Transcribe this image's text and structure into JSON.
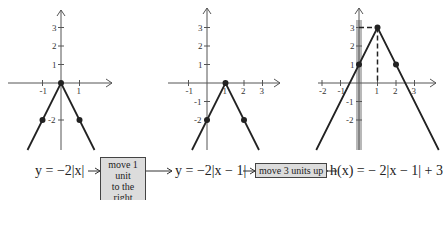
{
  "graphs": [
    {
      "name": "graph-base",
      "function": "y = -2|x|",
      "x_ticks": [
        "-1",
        "1"
      ],
      "x_tick_values": [
        -1,
        1
      ],
      "y_ticks": [
        "1",
        "2",
        "3",
        "-2"
      ],
      "y_tick_values": [
        1,
        2,
        3,
        -2
      ],
      "vertex": [
        0,
        0
      ],
      "points": [
        [
          0,
          0
        ],
        [
          -1,
          -2
        ],
        [
          1,
          -2
        ]
      ]
    },
    {
      "name": "graph-shift-right",
      "function": "y = -2|x - 1|",
      "x_ticks": [
        "-1",
        "1",
        "2",
        "3"
      ],
      "x_tick_values": [
        -1,
        1,
        2,
        3
      ],
      "y_ticks": [
        "1",
        "2",
        "3",
        "-1",
        "-2"
      ],
      "y_tick_values": [
        1,
        2,
        3,
        -1,
        -2
      ],
      "vertex": [
        1,
        0
      ],
      "points": [
        [
          1,
          0
        ],
        [
          0,
          -2
        ],
        [
          2,
          -2
        ]
      ]
    },
    {
      "name": "graph-shift-up",
      "function": "h(x) = -2|x - 1| + 3",
      "x_ticks": [
        "-2",
        "-1",
        "1",
        "2",
        "3"
      ],
      "x_tick_values": [
        -2,
        -1,
        1,
        2,
        3
      ],
      "y_ticks": [
        "1",
        "2",
        "3",
        "-1",
        "-2"
      ],
      "y_tick_values": [
        1,
        2,
        3,
        -1,
        -2
      ],
      "vertex": [
        1,
        3
      ],
      "points": [
        [
          1,
          3
        ],
        [
          0,
          1
        ],
        [
          2,
          1
        ]
      ]
    }
  ],
  "equations": {
    "eq1": "y = −2|x|",
    "eq2": "y = −2|x − 1|",
    "eq3": "h(x) = − 2|x − 1| + 3"
  },
  "steps": {
    "step1_line1": "move 1 unit",
    "step1_line2": "to the right",
    "step2": "move 3 units up"
  },
  "colors": {
    "line": "#222222",
    "axis": "#555555",
    "highlight": "#9a9a9a",
    "box": "#dcdcdc"
  }
}
